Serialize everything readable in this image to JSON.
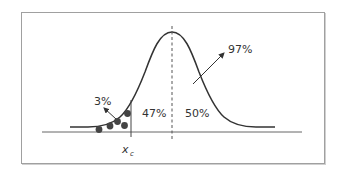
{
  "diagram": {
    "type": "normal-distribution",
    "labels": {
      "left_tail": "3%",
      "center_left": "47%",
      "center_right": "50%",
      "upper": "97%",
      "critical_value": "x",
      "critical_value_sub": "c"
    },
    "data_points_count": 5,
    "colors": {
      "curve": "#333333",
      "axis": "#555555",
      "dots": "#444444",
      "frame": "#a0a0a0"
    }
  }
}
